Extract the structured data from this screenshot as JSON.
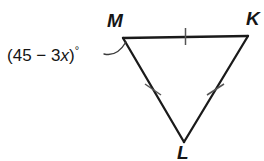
{
  "figure": {
    "background_color": "#ffffff",
    "edge_color": "#1a1a1a",
    "tick_color": "#555555",
    "leader_color": "#3a3a3a",
    "text_color": "#151515",
    "vertices": [
      {
        "name": "M",
        "label": "M",
        "x": 123,
        "y": 38
      },
      {
        "name": "K",
        "label": "K",
        "x": 248,
        "y": 36
      },
      {
        "name": "L",
        "label": "L",
        "x": 184,
        "y": 142
      }
    ],
    "sides": [
      {
        "name": "MK",
        "from": "M",
        "to": "K",
        "tick_marks": 1
      },
      {
        "name": "KL",
        "from": "K",
        "to": "L",
        "tick_marks": 1
      },
      {
        "name": "LM",
        "from": "L",
        "to": "M",
        "tick_marks": 1
      }
    ],
    "angle_label": {
      "at_vertex": "M",
      "open_paren": "(",
      "constant": "45",
      "operator": "−",
      "coefficient": "3",
      "variable": "x",
      "close_paren": ")",
      "degree_symbol": "°",
      "text": "(45 − 3x)°"
    }
  }
}
